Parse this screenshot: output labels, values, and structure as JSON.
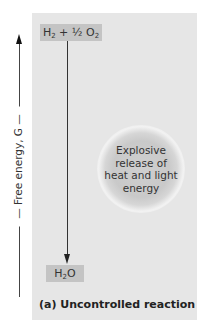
{
  "diagram": {
    "axis": {
      "label": "Free energy, G",
      "direction": "up"
    },
    "reactants": {
      "text_parts": [
        "H",
        "2",
        " + ½ O",
        "2"
      ],
      "label": "H2 + 1/2 O2"
    },
    "products": {
      "text_parts": [
        "H",
        "2",
        "O"
      ],
      "label": "H2O"
    },
    "process": {
      "lines": [
        "Explosive",
        "release of",
        "heat and light",
        "energy"
      ]
    },
    "caption": "(a) Uncontrolled reaction",
    "colors": {
      "panel": "#e6e6e6",
      "box": "#c4c4c4",
      "text": "#333333"
    }
  }
}
